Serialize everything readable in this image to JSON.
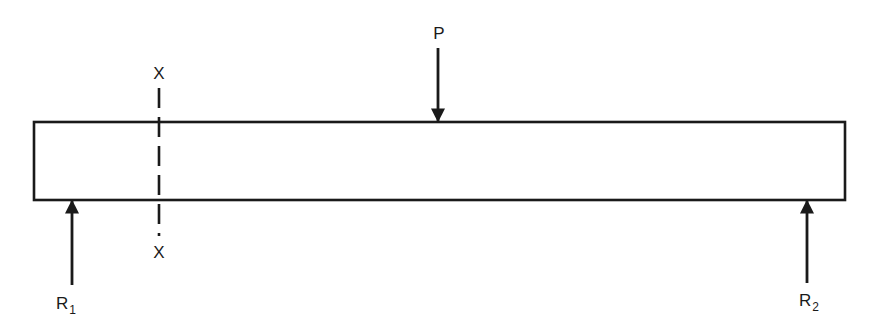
{
  "diagram": {
    "type": "simply-supported-beam",
    "colors": {
      "stroke": "#1a1a1a",
      "background": "#ffffff"
    },
    "beam": {
      "left": 34,
      "right": 845,
      "top": 122,
      "bottom": 200
    },
    "load": {
      "label": "P",
      "x": 438,
      "direction": "down"
    },
    "section": {
      "label_top": "X",
      "label_bottom": "X",
      "x": 159,
      "style": "dashed"
    },
    "reactions": [
      {
        "label": "R",
        "subscript": "1",
        "x": 72,
        "direction": "up"
      },
      {
        "label": "R",
        "subscript": "2",
        "x": 807,
        "direction": "up"
      }
    ]
  }
}
